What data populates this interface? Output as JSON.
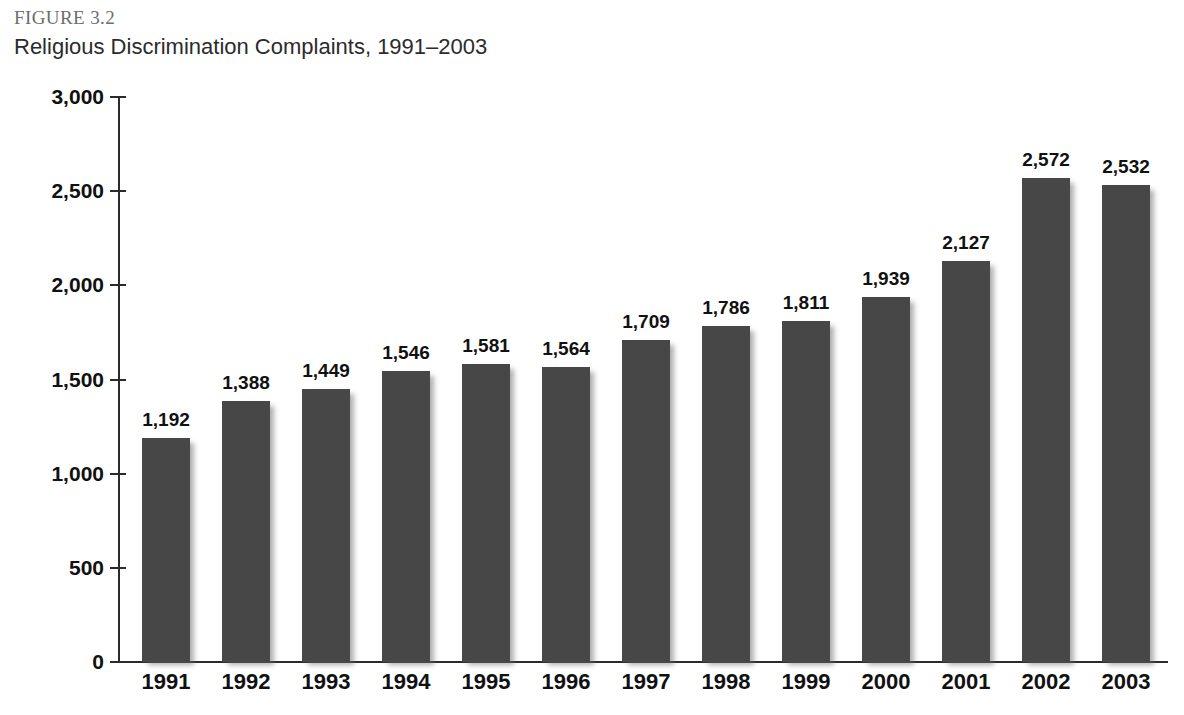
{
  "figure": {
    "number": "FIGURE 3.2",
    "title": "Religious Discrimination Complaints, 1991–2003"
  },
  "chart_data": {
    "type": "bar",
    "title": "Religious Discrimination Complaints, 1991–2003",
    "xlabel": "",
    "ylabel": "",
    "ylim": [
      0,
      3000
    ],
    "grid": false,
    "legend": null,
    "bar_color": "#474747",
    "categories": [
      "1991",
      "1992",
      "1993",
      "1994",
      "1995",
      "1996",
      "1997",
      "1998",
      "1999",
      "2000",
      "2001",
      "2002",
      "2003"
    ],
    "values": [
      1192,
      1388,
      1449,
      1546,
      1581,
      1564,
      1709,
      1786,
      1811,
      1939,
      2127,
      2572,
      2532
    ],
    "value_labels": [
      "1,192",
      "1,388",
      "1,449",
      "1,546",
      "1,581",
      "1,564",
      "1,709",
      "1,786",
      "1,811",
      "1,939",
      "2,127",
      "2,572",
      "2,532"
    ],
    "ytick_values": [
      0,
      500,
      1000,
      1500,
      2000,
      2500,
      3000
    ],
    "ytick_labels": [
      "0",
      "500",
      "1,000",
      "1,500",
      "2,000",
      "2,500",
      "3,000"
    ]
  }
}
